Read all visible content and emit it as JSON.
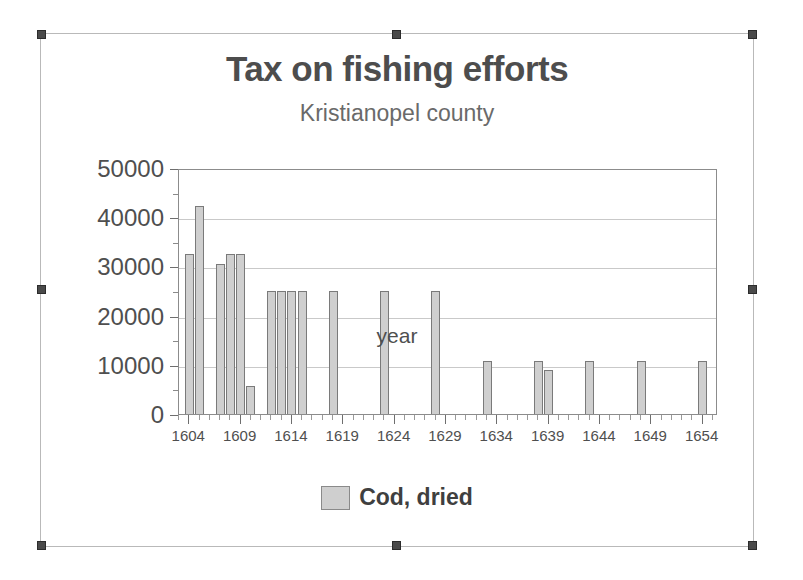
{
  "object": {
    "selected": true,
    "handle_count": 8,
    "frame_color": "#b9b9b9",
    "handle_color": "#4a4a4a"
  },
  "chart_data": {
    "type": "bar",
    "title": "Tax on fishing efforts",
    "subtitle": "Kristianopel county",
    "xlabel": "year",
    "ylabel": "",
    "grid": true,
    "legend_position": "bottom",
    "series_color": "#cfcfcf",
    "series_border_color": "#7a7a7a",
    "xlim": [
      1603,
      1655.5
    ],
    "ylim": [
      0,
      50000
    ],
    "y_major_step": 10000,
    "y_minor_step": 5000,
    "x_major_step": 5,
    "x_minor_step": 1,
    "ytick_labels": [
      "0",
      "10000",
      "20000",
      "30000",
      "40000",
      "50000"
    ],
    "ytick_values": [
      0,
      10000,
      20000,
      30000,
      40000,
      50000
    ],
    "xtick_labels": [
      "1604",
      "1609",
      "1614",
      "1619",
      "1624",
      "1629",
      "1634",
      "1639",
      "1644",
      "1649",
      "1654"
    ],
    "xtick_values": [
      1604,
      1609,
      1614,
      1619,
      1624,
      1629,
      1634,
      1639,
      1644,
      1649,
      1654
    ],
    "series": [
      {
        "name": "Cod, dried",
        "x": [
          1604,
          1605,
          1607,
          1608,
          1609,
          1610,
          1612,
          1613,
          1614,
          1615,
          1618,
          1623,
          1628,
          1633,
          1638,
          1639,
          1643,
          1648,
          1654
        ],
        "values": [
          32500,
          42200,
          30500,
          32500,
          32500,
          5600,
          25000,
          25000,
          25000,
          25000,
          25000,
          25000,
          25000,
          10700,
          10700,
          9000,
          10700,
          10700,
          10700
        ]
      }
    ],
    "legend": [
      {
        "label": "Cod, dried",
        "color": "#cfcfcf"
      }
    ]
  }
}
